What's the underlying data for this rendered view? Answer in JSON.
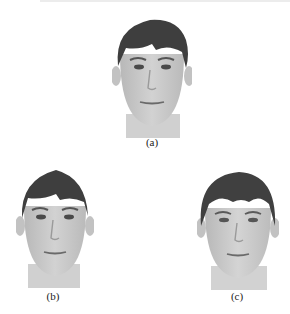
{
  "figure": {
    "panels": [
      {
        "id": "a",
        "caption": "(a)",
        "description": "frontal face photograph, grayscale"
      },
      {
        "id": "b",
        "caption": "(b)",
        "description": "frontal face photograph, grayscale, slightly narrower variant"
      },
      {
        "id": "c",
        "caption": "(c)",
        "description": "frontal face photograph, grayscale, variant with fuller hair"
      }
    ]
  },
  "colors": {
    "hair": "#3a3a3a",
    "skin": "#c9c9c9",
    "skin_shade": "#b4b4b4",
    "feature": "#555555",
    "background": "#ffffff"
  }
}
